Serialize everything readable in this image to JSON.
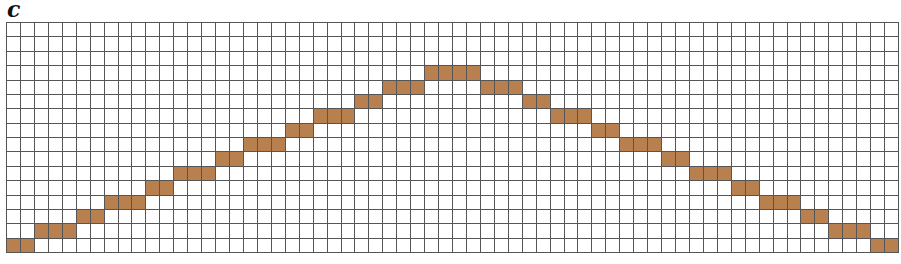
{
  "panel": {
    "label": "c"
  },
  "colors": {
    "fill": "#b8804f",
    "grid_line": "#555555",
    "background": "#ffffff"
  },
  "chart_data": {
    "type": "heatmap",
    "title": "",
    "columns": 64,
    "rows": 16,
    "row_index_origin": "bottom",
    "filled_cells_by_column": [
      0,
      0,
      1,
      1,
      1,
      2,
      2,
      3,
      3,
      3,
      4,
      4,
      5,
      5,
      5,
      6,
      6,
      7,
      7,
      7,
      8,
      8,
      9,
      9,
      9,
      10,
      10,
      11,
      11,
      11,
      12,
      12,
      12,
      12,
      11,
      11,
      11,
      10,
      10,
      9,
      9,
      9,
      8,
      8,
      7,
      7,
      7,
      6,
      6,
      5,
      5,
      5,
      4,
      4,
      3,
      3,
      3,
      2,
      2,
      1,
      1,
      1,
      0,
      0
    ],
    "segments": [
      {
        "row": 0,
        "cols": [
          0,
          1
        ]
      },
      {
        "row": 1,
        "cols": [
          2,
          4
        ]
      },
      {
        "row": 2,
        "cols": [
          5,
          6
        ]
      },
      {
        "row": 3,
        "cols": [
          7,
          9
        ]
      },
      {
        "row": 4,
        "cols": [
          10,
          11
        ]
      },
      {
        "row": 5,
        "cols": [
          12,
          14
        ]
      },
      {
        "row": 6,
        "cols": [
          15,
          16
        ]
      },
      {
        "row": 7,
        "cols": [
          17,
          19
        ]
      },
      {
        "row": 8,
        "cols": [
          20,
          21
        ]
      },
      {
        "row": 9,
        "cols": [
          22,
          24
        ]
      },
      {
        "row": 10,
        "cols": [
          25,
          26
        ]
      },
      {
        "row": 11,
        "cols": [
          27,
          29
        ]
      },
      {
        "row": 12,
        "cols": [
          30,
          33
        ]
      },
      {
        "row": 11,
        "cols": [
          34,
          36
        ]
      },
      {
        "row": 10,
        "cols": [
          37,
          38
        ]
      },
      {
        "row": 9,
        "cols": [
          39,
          41
        ]
      },
      {
        "row": 8,
        "cols": [
          42,
          43
        ]
      },
      {
        "row": 7,
        "cols": [
          44,
          46
        ]
      },
      {
        "row": 6,
        "cols": [
          47,
          48
        ]
      },
      {
        "row": 5,
        "cols": [
          49,
          51
        ]
      },
      {
        "row": 4,
        "cols": [
          52,
          53
        ]
      },
      {
        "row": 3,
        "cols": [
          54,
          56
        ]
      },
      {
        "row": 2,
        "cols": [
          57,
          58
        ]
      },
      {
        "row": 1,
        "cols": [
          59,
          61
        ]
      },
      {
        "row": 0,
        "cols": [
          62,
          63
        ]
      }
    ],
    "grid": true
  }
}
